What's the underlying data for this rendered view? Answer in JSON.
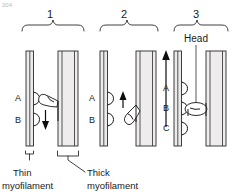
{
  "figure": {
    "corner_note": "204",
    "panels": [
      {
        "number": "1",
        "site_labels": [
          "A",
          "B"
        ],
        "attached_site": "A",
        "arrow_direction": "down",
        "description": "Myosin head attached at site A, power stroke pulling downward"
      },
      {
        "number": "2",
        "site_labels": [
          "A",
          "B"
        ],
        "attached_site": "none",
        "arrow_direction": "up",
        "description": "Myosin head detached, swinging upward to next site"
      },
      {
        "number": "3",
        "site_labels": [
          "A",
          "B",
          "C"
        ],
        "attached_site": "B",
        "arrow_direction": "up",
        "description": "Myosin head re-attached at site B after filament slid"
      }
    ],
    "head_label": "Head",
    "captions": {
      "thin": "Thin\nmyofilament",
      "thin_line1": "Thin",
      "thin_line2": "myofilament",
      "thick_line1": "Thick",
      "thick_line2": "myofilament"
    },
    "colors": {
      "ink": "#1a1a1a",
      "filament_fill": "#eceaea",
      "background": "#ffffff",
      "arrow": "#0d0d0d"
    }
  }
}
